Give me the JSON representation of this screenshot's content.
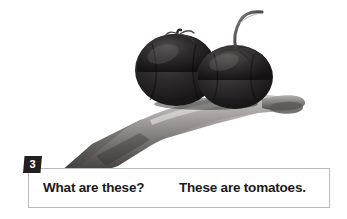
{
  "page": {
    "background_color": "#ffffff",
    "width": 347,
    "height": 219
  },
  "photo": {
    "description": "Black-and-white photograph of an open hand holding two tomatoes",
    "subject": "two tomatoes on an open palm",
    "style": "grayscale photo",
    "objects": [
      {
        "name": "tomato-left",
        "label": "tomato"
      },
      {
        "name": "tomato-right",
        "label": "tomato"
      },
      {
        "name": "hand",
        "label": "hand"
      }
    ],
    "colors": {
      "tomato_dark": "#1d1b1c",
      "tomato_mid": "#2e2b2c",
      "tomato_highlight": "#4a4647",
      "hand_light": "#d6d2cf",
      "hand_mid": "#8e8a88",
      "hand_dark": "#4d4a49",
      "background": "#ffffff"
    }
  },
  "badge": {
    "number": "3",
    "background_color": "#231f20",
    "text_color": "#ffffff"
  },
  "caption": {
    "question": "What are these?",
    "answer": "These are tomatoes.",
    "border_color": "#b9bcbe",
    "background_color": "#ffffff",
    "text_color": "#1a1a1a"
  }
}
